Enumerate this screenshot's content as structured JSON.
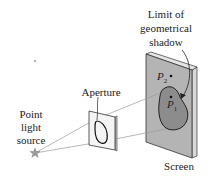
{
  "diagram": {
    "labels": {
      "limit_line1": "Limit of",
      "limit_line2": "geometrical",
      "limit_line3": "shadow",
      "aperture": "Aperture",
      "source_line1": "Point",
      "source_line2": "light",
      "source_line3": "source",
      "screen": "Screen",
      "p2": "P",
      "p2_sub": "2",
      "p1": "P",
      "p1_sub": "1"
    },
    "colors": {
      "screen_face": "#b4b4b4",
      "screen_edge": "#d8d8d8",
      "shadow": "#8c8c8c",
      "aperture_plate": "#f4f4f4",
      "star": "#9a9a9a",
      "ray": "#9a9a9a",
      "ink": "#222222"
    }
  }
}
